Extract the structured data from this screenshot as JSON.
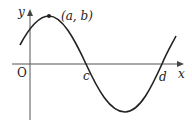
{
  "diagram": {
    "type": "sinusoidal-graph",
    "axes": {
      "x_label": "x",
      "y_label": "y",
      "origin_label": "O"
    },
    "points": {
      "max_point_label": "(a, b)",
      "first_zero_label": "c",
      "second_zero_label": "d"
    },
    "colors": {
      "curve": "#222222",
      "axes": "#555555",
      "background": "#ffffff"
    }
  }
}
